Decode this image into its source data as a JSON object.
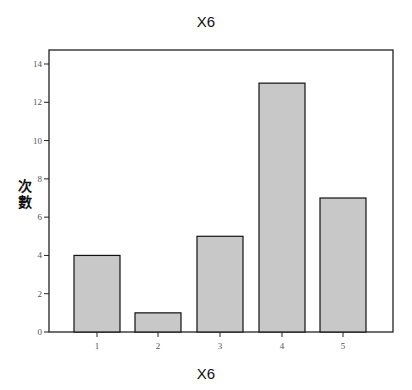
{
  "chart_data": {
    "type": "bar",
    "title": "X6",
    "xlabel": "X6",
    "ylabel": "次數",
    "categories": [
      "1",
      "2",
      "3",
      "4",
      "5"
    ],
    "values": [
      4,
      1,
      5,
      13,
      7
    ],
    "ylim": [
      0,
      14.7
    ],
    "yticks": [
      0,
      2,
      4,
      6,
      8,
      10,
      12,
      14
    ],
    "grid": false,
    "legend": null,
    "bar_color": "#c8c8c8",
    "edge_color": "#111111"
  }
}
